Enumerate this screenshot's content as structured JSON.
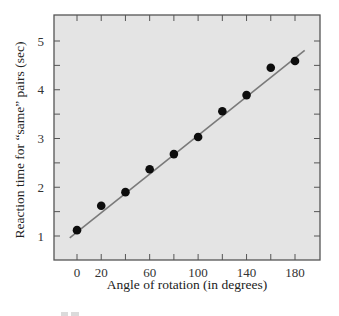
{
  "chart_data": {
    "type": "scatter",
    "title": "",
    "xlabel": "Angle of rotation (in degrees)",
    "ylabel": "Reaction time for “same” pairs (sec)",
    "x_tick_labels": [
      "0",
      "20",
      "60",
      "100",
      "140",
      "180"
    ],
    "x_ticks": [
      0,
      20,
      40,
      60,
      80,
      100,
      120,
      140,
      160,
      180
    ],
    "y_tick_labels": [
      "1",
      "2",
      "3",
      "4",
      "5"
    ],
    "y_ticks": [
      1,
      1.5,
      2,
      2.5,
      3,
      3.5,
      4,
      4.5,
      5
    ],
    "xlim": [
      -20,
      200
    ],
    "ylim": [
      0.53,
      5.55
    ],
    "grid": false,
    "legend": null,
    "series": [
      {
        "name": "Observed reaction times",
        "kind": "points",
        "x": [
          0,
          20,
          40,
          60,
          80,
          100,
          120,
          140,
          160,
          180
        ],
        "y": [
          1.12,
          1.62,
          1.9,
          2.37,
          2.68,
          3.03,
          3.56,
          3.89,
          4.45,
          4.59
        ]
      },
      {
        "name": "Linear fit",
        "kind": "line",
        "x": [
          -6,
          188
        ],
        "y": [
          0.96,
          4.81
        ]
      }
    ],
    "colors": {
      "plot_background": "#e4e4e4",
      "frame": "#555555",
      "points": "#0d0d0d",
      "fit_line": "#7a7a7a"
    }
  }
}
